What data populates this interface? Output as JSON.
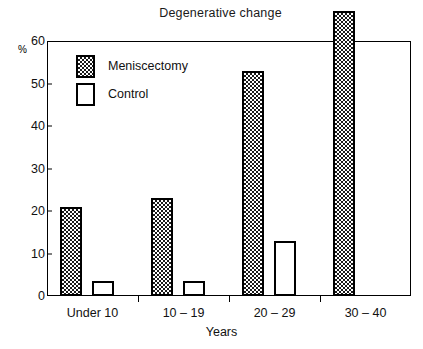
{
  "chart_data": {
    "type": "bar",
    "title": "Degenerative change",
    "xlabel": "Years",
    "ylabel": "%",
    "ylim": [
      0,
      60
    ],
    "yticks": [
      0,
      10,
      20,
      30,
      40,
      50,
      60
    ],
    "grid": false,
    "legend_position": "top-left inside plot",
    "categories": [
      "Under 10",
      "10 – 19",
      "20 – 29",
      "30 – 40"
    ],
    "series": [
      {
        "name": "Meniscectomy",
        "fill": "checkered",
        "values": [
          21,
          23,
          53,
          67
        ]
      },
      {
        "name": "Control",
        "fill": "white",
        "values": [
          3.5,
          3.5,
          13,
          null
        ]
      }
    ]
  },
  "colors": {
    "ink": "#000000",
    "pattern": "#1a1a1a",
    "background": "#ffffff"
  }
}
